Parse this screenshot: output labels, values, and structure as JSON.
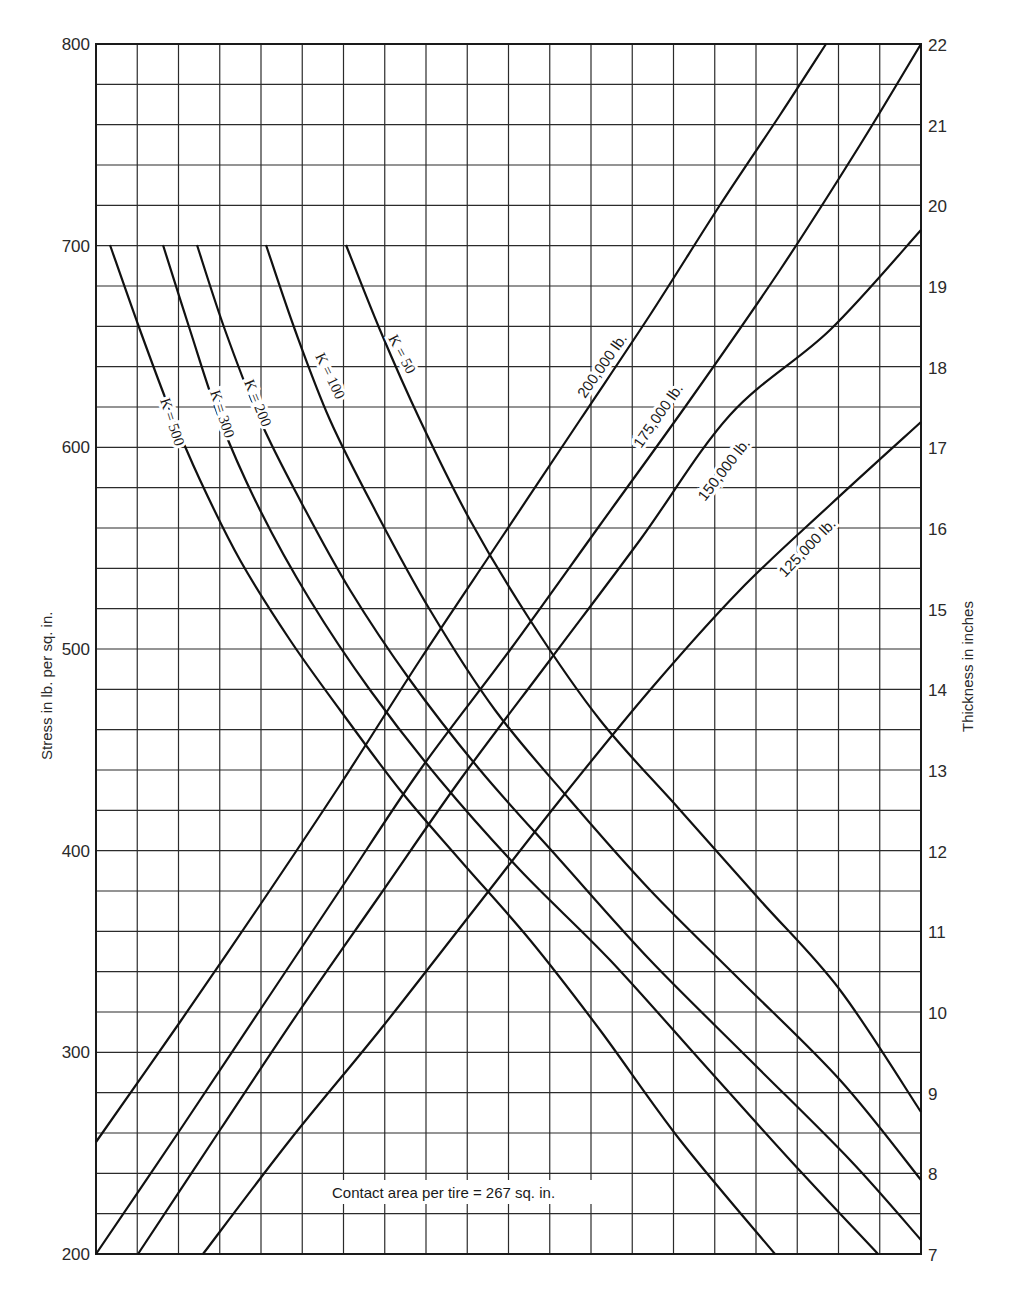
{
  "chart_data": {
    "type": "line",
    "title": "",
    "annotation": "Contact area per tire = 267 sq. in.",
    "ylabel": "Stress in lb. per sq. in.",
    "y2label": "Thickness in inches",
    "xlabel": "",
    "ylim": [
      200,
      800
    ],
    "y2lim": [
      7,
      22
    ],
    "y_ticks": [
      "200",
      "300",
      "400",
      "500",
      "600",
      "700",
      "800"
    ],
    "y2_ticks": [
      "7",
      "8",
      "9",
      "10",
      "11",
      "12",
      "13",
      "14",
      "15",
      "16",
      "17",
      "18",
      "19",
      "20",
      "21",
      "22"
    ],
    "grid": true,
    "grid_columns": 20,
    "grid_rows": 30,
    "series": [
      {
        "name": "K = 500",
        "group": "subgrade_modulus",
        "axis": "left",
        "points_px": [
          [
            110,
            245
          ],
          [
            140,
            330
          ],
          [
            170,
            410
          ],
          [
            200,
            480
          ],
          [
            240,
            560
          ],
          [
            290,
            640
          ],
          [
            340,
            710
          ],
          [
            400,
            790
          ],
          [
            460,
            860
          ],
          [
            530,
            940
          ],
          [
            600,
            1030
          ],
          [
            680,
            1140
          ],
          [
            775,
            1254
          ]
        ]
      },
      {
        "name": "K = 300",
        "group": "subgrade_modulus",
        "axis": "left",
        "points_px": [
          [
            163,
            245
          ],
          [
            190,
            330
          ],
          [
            220,
            420
          ],
          [
            260,
            510
          ],
          [
            310,
            600
          ],
          [
            370,
            690
          ],
          [
            440,
            780
          ],
          [
            520,
            870
          ],
          [
            610,
            960
          ],
          [
            700,
            1060
          ],
          [
            790,
            1160
          ],
          [
            878,
            1254
          ]
        ]
      },
      {
        "name": "K = 200",
        "group": "subgrade_modulus",
        "axis": "left",
        "points_px": [
          [
            197,
            245
          ],
          [
            225,
            330
          ],
          [
            260,
            420
          ],
          [
            300,
            500
          ],
          [
            350,
            590
          ],
          [
            410,
            680
          ],
          [
            480,
            770
          ],
          [
            560,
            860
          ],
          [
            650,
            960
          ],
          [
            750,
            1060
          ],
          [
            850,
            1160
          ],
          [
            921,
            1240
          ]
        ]
      },
      {
        "name": "K = 100",
        "group": "subgrade_modulus",
        "axis": "left",
        "points_px": [
          [
            266,
            245
          ],
          [
            295,
            330
          ],
          [
            330,
            420
          ],
          [
            375,
            510
          ],
          [
            430,
            610
          ],
          [
            495,
            710
          ],
          [
            570,
            800
          ],
          [
            650,
            890
          ],
          [
            740,
            980
          ],
          [
            840,
            1080
          ],
          [
            921,
            1180
          ]
        ]
      },
      {
        "name": "K = 50",
        "group": "subgrade_modulus",
        "axis": "left",
        "points_px": [
          [
            346,
            245
          ],
          [
            380,
            330
          ],
          [
            420,
            420
          ],
          [
            470,
            520
          ],
          [
            530,
            620
          ],
          [
            600,
            720
          ],
          [
            680,
            810
          ],
          [
            760,
            900
          ],
          [
            840,
            990
          ],
          [
            921,
            1112
          ]
        ]
      },
      {
        "name": "200,000 lb.",
        "group": "gear_load",
        "axis": "right",
        "points_px": [
          [
            96,
            1142
          ],
          [
            180,
            1022
          ],
          [
            260,
            905
          ],
          [
            340,
            785
          ],
          [
            420,
            660
          ],
          [
            500,
            540
          ],
          [
            580,
            420
          ],
          [
            650,
            315
          ],
          [
            720,
            205
          ],
          [
            780,
            115
          ],
          [
            826,
            44
          ]
        ]
      },
      {
        "name": "175,000 lb.",
        "group": "gear_load",
        "axis": "right",
        "points_px": [
          [
            96,
            1254
          ],
          [
            180,
            1130
          ],
          [
            260,
            1010
          ],
          [
            340,
            890
          ],
          [
            420,
            770
          ],
          [
            510,
            650
          ],
          [
            600,
            525
          ],
          [
            690,
            400
          ],
          [
            780,
            270
          ],
          [
            860,
            145
          ],
          [
            921,
            44
          ]
        ]
      },
      {
        "name": "150,000 lb.",
        "group": "gear_load",
        "axis": "right",
        "points_px": [
          [
            138,
            1254
          ],
          [
            220,
            1130
          ],
          [
            300,
            1010
          ],
          [
            380,
            895
          ],
          [
            460,
            780
          ],
          [
            550,
            660
          ],
          [
            640,
            540
          ],
          [
            730,
            415
          ],
          [
            830,
            330
          ],
          [
            921,
            230
          ]
        ]
      },
      {
        "name": "125,000 lb.",
        "group": "gear_load",
        "axis": "right",
        "points_px": [
          [
            203,
            1254
          ],
          [
            290,
            1140
          ],
          [
            380,
            1030
          ],
          [
            470,
            915
          ],
          [
            560,
            800
          ],
          [
            650,
            690
          ],
          [
            740,
            590
          ],
          [
            830,
            505
          ],
          [
            921,
            422
          ]
        ]
      }
    ]
  },
  "labels": {
    "k500": "K = 500",
    "k300": "K = 300",
    "k200": "K = 200",
    "k100": "K = 100",
    "k50": "K = 50",
    "l200": "200,000 lb.",
    "l175": "175,000 lb.",
    "l150": "150,000 lb.",
    "l125": "125,000 lb."
  }
}
